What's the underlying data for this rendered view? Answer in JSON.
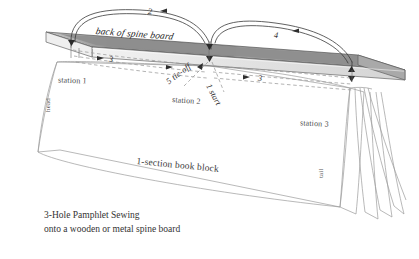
{
  "figure": {
    "title_lines": [
      "3-Hole Pamphlet Sewing",
      "onto a wooden or metal spine board"
    ],
    "spine_board_label": "back of spine board",
    "book_block_label": "1-section book block",
    "edge_labels": {
      "head": "head",
      "tail": "tail"
    },
    "stations": [
      {
        "id": "station-1",
        "label": "station 1"
      },
      {
        "id": "station-2",
        "label": "station 2"
      },
      {
        "id": "station-3",
        "label": "station 3"
      }
    ],
    "sewing_steps": [
      {
        "id": "step-1",
        "label": "1 start"
      },
      {
        "id": "step-2",
        "label": "2"
      },
      {
        "id": "step-3a",
        "label": "3"
      },
      {
        "id": "step-3b",
        "label": "3"
      },
      {
        "id": "step-4",
        "label": "4"
      },
      {
        "id": "step-5",
        "label": "5 tie-off"
      }
    ],
    "colors": {
      "board_top": "#9a9a9a",
      "board_top_light": "#e7e7e7",
      "board_edge": "#7d7d7d",
      "outline": "#3d3d3d",
      "paper": "#ffffff",
      "paper_line": "#9b9b9b",
      "thread": "#2f2f2f",
      "thread_hidden": "#8e8e8e"
    }
  }
}
